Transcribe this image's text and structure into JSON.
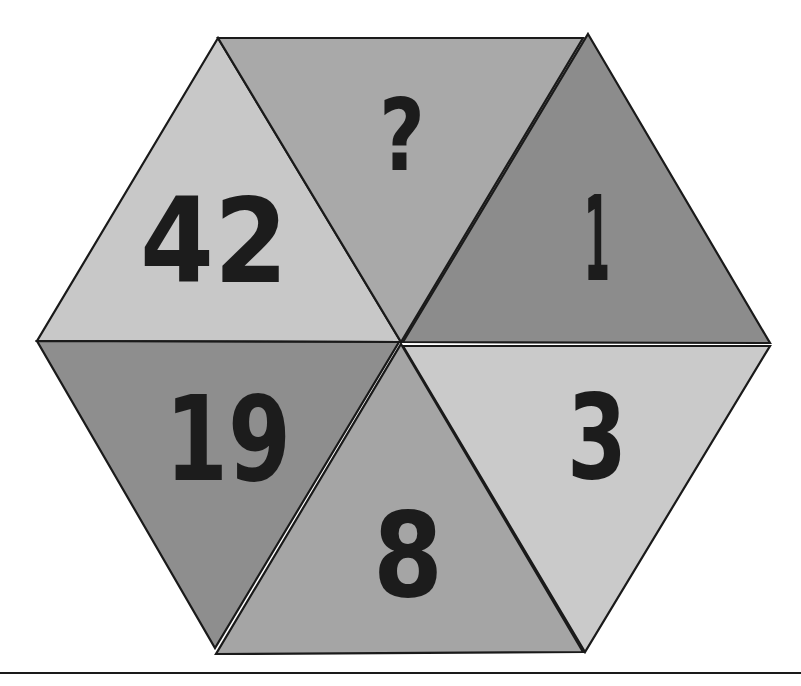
{
  "puzzle": {
    "title": "Hexagon number puzzle",
    "shape": "hexagon divided into 6 triangles",
    "triangles": [
      {
        "position": "top-left",
        "label": "42",
        "fill": "#c8c8c8"
      },
      {
        "position": "top-center",
        "label": "?",
        "fill": "#a9a9a9"
      },
      {
        "position": "top-right",
        "label": "1",
        "fill": "#8c8c8c"
      },
      {
        "position": "bottom-right",
        "label": "3",
        "fill": "#cacaca"
      },
      {
        "position": "bottom-center",
        "label": "8",
        "fill": "#a5a5a5"
      },
      {
        "position": "bottom-left",
        "label": "19",
        "fill": "#8e8e8e"
      }
    ],
    "unknown_marker": "?"
  },
  "colors": {
    "outline": "#1a1a1a",
    "text": "#1c1c1c",
    "background": "#ffffff"
  }
}
